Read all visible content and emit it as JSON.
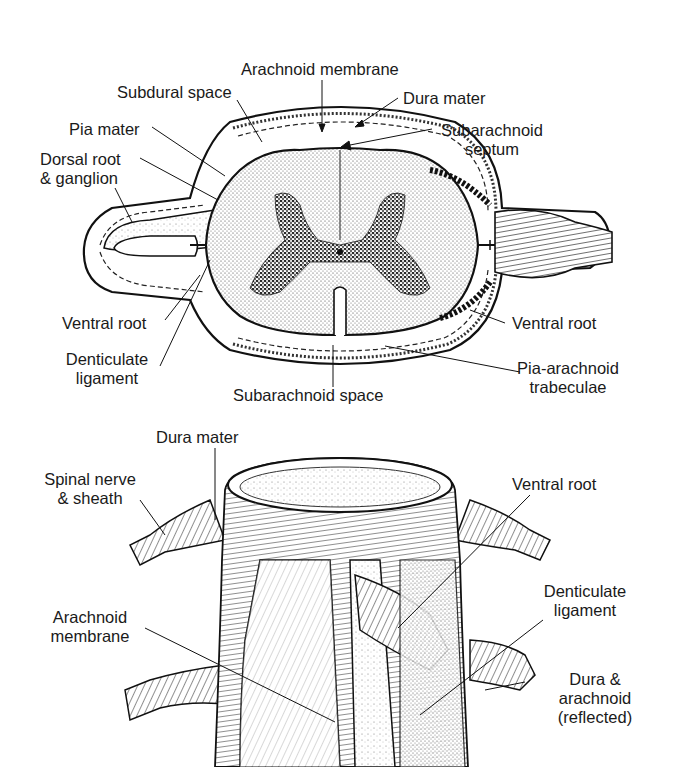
{
  "figure": {
    "top_panel": {
      "name": "Cross-section of spinal cord and meninges",
      "labels": {
        "arachnoid_membrane": "Arachnoid membrane",
        "subdural_space": "Subdural space",
        "dura_mater": "Dura mater",
        "pia_mater": "Pia mater",
        "subarachnoid_septum_1": "Subarachnoid",
        "subarachnoid_septum_2": "septum",
        "dorsal_root_1": "Dorsal root",
        "dorsal_root_2": "& ganglion",
        "ventral_root_left": "Ventral root",
        "ventral_root_right": "Ventral root",
        "denticulate_1": "Denticulate",
        "denticulate_2": "ligament",
        "pia_arachnoid_1": "Pia-arachnoid",
        "pia_arachnoid_2": "trabeculae",
        "subarachnoid_space": "Subarachnoid space"
      }
    },
    "bottom_panel": {
      "name": "Spinal cord with meninges opened, ventral view",
      "labels": {
        "dura_mater": "Dura mater",
        "spinal_nerve_1": "Spinal nerve",
        "spinal_nerve_2": "& sheath",
        "ventral_root": "Ventral root",
        "denticulate_1": "Denticulate",
        "denticulate_2": "ligament",
        "arachnoid_1": "Arachnoid",
        "arachnoid_2": "membrane",
        "dura_arachnoid_1": "Dura &",
        "dura_arachnoid_2": "arachnoid",
        "dura_arachnoid_3": "(reflected)"
      }
    }
  }
}
